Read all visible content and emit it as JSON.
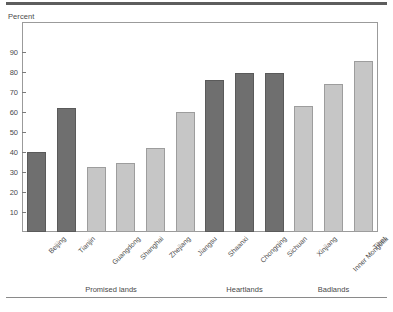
{
  "figure": {
    "axis_unit_label": "Percent",
    "colors": {
      "dark_bar": "#6f6f6f",
      "light_bar": "#c6c6c6",
      "frame": "#9b9b9b",
      "rule": "#5d5d5d",
      "text": "#4a4a4a"
    }
  },
  "chart_data": {
    "type": "bar",
    "title": "",
    "subtitle": "",
    "xlabel": "",
    "ylabel": "Percent",
    "ylim": [
      0,
      95
    ],
    "yticks": [
      10,
      20,
      30,
      40,
      50,
      60,
      70,
      80,
      90
    ],
    "ytick_labels": [
      "10",
      "20",
      "30",
      "40",
      "50",
      "60",
      "70",
      "80",
      "90"
    ],
    "grid": false,
    "legend": null,
    "legend_position": "none",
    "categories": [
      "Beijing",
      "Tianjin",
      "Guangdong",
      "Shanghai",
      "Zhejiang",
      "Jiangsu",
      "Shaanxi",
      "Chongqing",
      "Sichuan",
      "Xinjiang",
      "Inner Mongolia",
      "Tibet"
    ],
    "values": [
      40,
      62,
      32.5,
      34.5,
      42,
      60,
      76,
      79.5,
      79.5,
      63,
      74,
      85.5
    ],
    "bar_shades": [
      "dark",
      "dark",
      "light",
      "light",
      "light",
      "light",
      "dark",
      "dark",
      "dark",
      "light",
      "light",
      "light"
    ],
    "groups": [
      {
        "label": "Promised lands",
        "first_index": 0,
        "last_index": 5
      },
      {
        "label": "Heartlands",
        "first_index": 6,
        "last_index": 8
      },
      {
        "label": "Badlands",
        "first_index": 9,
        "last_index": 11
      }
    ]
  }
}
